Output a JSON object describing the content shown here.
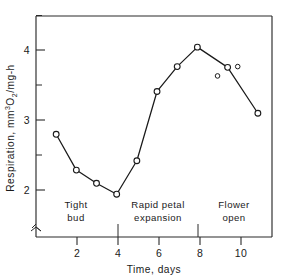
{
  "chart_data": {
    "type": "line",
    "title": "",
    "xlabel": "Time, days",
    "ylabel": "Respiration, mm3O2/mg-h",
    "ylabel_parts": {
      "lead": "Respiration, mm",
      "sup": "3",
      "mid": "O",
      "sub": "2",
      "tail": "/mg-h"
    },
    "x": [
      1,
      2,
      3,
      4,
      5,
      6,
      7,
      8,
      9,
      11
    ],
    "values": [
      3.1,
      2.64,
      2.47,
      2.33,
      2.76,
      3.65,
      3.97,
      4.22,
      3.96,
      3.37
    ],
    "series": [
      {
        "name": "respiration",
        "connected": true,
        "points": [
          {
            "x": 1,
            "y": 3.1
          },
          {
            "x": 2,
            "y": 2.64
          },
          {
            "x": 3,
            "y": 2.47
          },
          {
            "x": 4,
            "y": 2.33
          },
          {
            "x": 5,
            "y": 2.76
          },
          {
            "x": 6,
            "y": 3.65
          },
          {
            "x": 7,
            "y": 3.97
          },
          {
            "x": 8,
            "y": 4.22
          },
          {
            "x": 9.5,
            "y": 3.96
          },
          {
            "x": 11,
            "y": 3.37
          }
        ]
      },
      {
        "name": "unconnected-observations",
        "connected": false,
        "points": [
          {
            "x": 9,
            "y": 3.85
          },
          {
            "x": 10,
            "y": 3.97
          }
        ]
      }
    ],
    "xlim": [
      0,
      11.7
    ],
    "ylim": [
      1.78,
      4.62
    ],
    "xticks": [
      2,
      4,
      6,
      8,
      10
    ],
    "xtick_labels": [
      "2",
      "4",
      "6",
      "8",
      "10"
    ],
    "yticks": [
      2,
      3,
      4
    ],
    "ytick_labels": [
      "2",
      "3",
      "4"
    ],
    "yticks_minor": [
      2.5,
      3.5,
      4.5
    ],
    "grid": false,
    "legend": "none",
    "axis_break": true,
    "annotations": [
      {
        "name": "phase-tight-bud",
        "lines": [
          "Tight",
          "bud"
        ],
        "x_center": 1.95,
        "divider_x": 4.0
      },
      {
        "name": "phase-rapid-petal-expansion",
        "lines": [
          "Rapid petal",
          "expansion"
        ],
        "x_center": 5.9,
        "divider_x": 7.9
      },
      {
        "name": "phase-flower-open",
        "lines": [
          "Flower",
          "open"
        ],
        "x_center": 9.6,
        "divider_x": null
      }
    ]
  },
  "colors": {
    "ink": "#1a1a1a",
    "axis": "#2a2a2a",
    "background": "#ffffff",
    "marker_fill": "#ffffff"
  }
}
